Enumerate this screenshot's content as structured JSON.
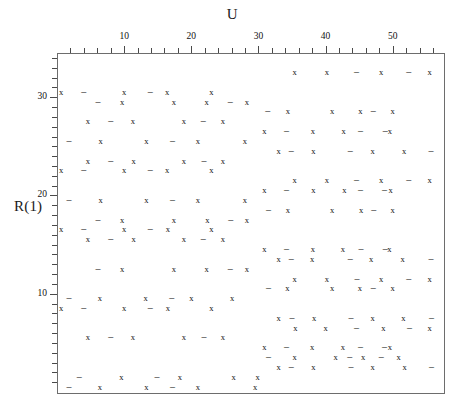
{
  "axes": {
    "x_title": "U",
    "y_title": "R(1)",
    "x_ticklabels": [
      "10",
      "20",
      "30",
      "40",
      "50"
    ],
    "x_tickvalues": [
      10,
      20,
      30,
      40,
      50
    ],
    "y_ticklabels": [
      "10",
      "20",
      "30"
    ],
    "y_tickvalues": [
      10,
      20,
      30
    ]
  },
  "footer": {
    "speck": ""
  },
  "chart_data": {
    "type": "scatter",
    "title": "",
    "xlabel": "U",
    "ylabel": "R(1)",
    "xlim": [
      0,
      57.5
    ],
    "ylim": [
      34.5,
      0
    ],
    "grid": false,
    "legend": "none",
    "x_major_ticks": [
      10,
      20,
      30,
      40,
      50
    ],
    "x_minor_tick_step": 2,
    "y_major_ticks": [
      10,
      20,
      30
    ],
    "y_minor_tick_step": 1,
    "marker_glyphs": {
      "x": "x",
      "dash": "–"
    },
    "series": [
      {
        "name": "x-markers",
        "glyph": "x",
        "points": [
          [
            6.4,
            0.55
          ],
          [
            13.3,
            0.55
          ],
          [
            21.0,
            0.55
          ],
          [
            29.5,
            0.55
          ],
          [
            9.6,
            1.55
          ],
          [
            18.3,
            1.55
          ],
          [
            26.3,
            1.55
          ],
          [
            29.9,
            1.55
          ],
          [
            33.0,
            2.55
          ],
          [
            38.2,
            2.55
          ],
          [
            47.0,
            2.55
          ],
          [
            51.8,
            2.55
          ],
          [
            35.4,
            3.55
          ],
          [
            41.5,
            3.55
          ],
          [
            45.6,
            3.55
          ],
          [
            50.9,
            3.55
          ],
          [
            30.9,
            4.55
          ],
          [
            38.0,
            4.55
          ],
          [
            42.6,
            4.55
          ],
          [
            49.6,
            4.55
          ],
          [
            4.6,
            5.55
          ],
          [
            11.3,
            5.55
          ],
          [
            18.9,
            5.55
          ],
          [
            24.7,
            5.55
          ],
          [
            35.5,
            6.55
          ],
          [
            40.0,
            6.55
          ],
          [
            48.6,
            6.55
          ],
          [
            55.5,
            6.55
          ],
          [
            33.0,
            7.55
          ],
          [
            38.3,
            7.55
          ],
          [
            47.0,
            7.55
          ],
          [
            51.6,
            7.55
          ],
          [
            0.6,
            8.55
          ],
          [
            10.0,
            8.55
          ],
          [
            16.5,
            8.55
          ],
          [
            23.0,
            8.55
          ],
          [
            6.4,
            9.55
          ],
          [
            13.2,
            9.55
          ],
          [
            20.0,
            9.55
          ],
          [
            26.1,
            9.55
          ],
          [
            34.3,
            10.55
          ],
          [
            41.0,
            10.55
          ],
          [
            45.1,
            10.55
          ],
          [
            50.0,
            10.55
          ],
          [
            35.4,
            11.55
          ],
          [
            40.2,
            11.55
          ],
          [
            48.3,
            11.55
          ],
          [
            55.5,
            11.55
          ],
          [
            9.7,
            12.55
          ],
          [
            17.4,
            12.55
          ],
          [
            22.3,
            12.55
          ],
          [
            28.3,
            12.55
          ],
          [
            33.0,
            13.55
          ],
          [
            38.0,
            13.55
          ],
          [
            46.8,
            13.55
          ],
          [
            51.5,
            13.55
          ],
          [
            30.9,
            14.55
          ],
          [
            38.1,
            14.55
          ],
          [
            42.6,
            14.55
          ],
          [
            49.5,
            14.55
          ],
          [
            4.6,
            15.55
          ],
          [
            11.4,
            15.55
          ],
          [
            18.9,
            15.55
          ],
          [
            24.7,
            15.55
          ],
          [
            0.6,
            16.55
          ],
          [
            10.0,
            16.55
          ],
          [
            16.5,
            16.55
          ],
          [
            23.0,
            16.55
          ],
          [
            9.7,
            17.55
          ],
          [
            17.4,
            17.55
          ],
          [
            22.4,
            17.55
          ],
          [
            28.3,
            17.55
          ],
          [
            34.4,
            18.55
          ],
          [
            41.0,
            18.55
          ],
          [
            45.3,
            18.55
          ],
          [
            50.0,
            18.55
          ],
          [
            6.5,
            19.55
          ],
          [
            13.3,
            19.55
          ],
          [
            21.0,
            19.55
          ],
          [
            28.0,
            19.55
          ],
          [
            30.9,
            20.55
          ],
          [
            38.2,
            20.55
          ],
          [
            42.8,
            20.55
          ],
          [
            49.7,
            20.55
          ],
          [
            35.4,
            21.55
          ],
          [
            40.2,
            21.55
          ],
          [
            48.3,
            21.55
          ],
          [
            55.5,
            21.55
          ],
          [
            0.6,
            22.55
          ],
          [
            10.0,
            22.55
          ],
          [
            16.4,
            22.55
          ],
          [
            23.0,
            22.55
          ],
          [
            4.6,
            23.55
          ],
          [
            11.4,
            23.55
          ],
          [
            18.9,
            23.55
          ],
          [
            24.7,
            23.55
          ],
          [
            33.0,
            24.55
          ],
          [
            38.2,
            24.55
          ],
          [
            47.0,
            24.55
          ],
          [
            51.7,
            24.55
          ],
          [
            6.5,
            25.55
          ],
          [
            13.3,
            25.55
          ],
          [
            21.0,
            25.55
          ],
          [
            28.0,
            25.55
          ],
          [
            30.9,
            26.55
          ],
          [
            38.1,
            26.55
          ],
          [
            42.7,
            26.55
          ],
          [
            49.6,
            26.55
          ],
          [
            4.6,
            27.55
          ],
          [
            11.3,
            27.55
          ],
          [
            18.9,
            27.55
          ],
          [
            24.7,
            27.55
          ],
          [
            34.4,
            28.55
          ],
          [
            41.0,
            28.55
          ],
          [
            45.2,
            28.55
          ],
          [
            50.0,
            28.55
          ],
          [
            9.7,
            29.55
          ],
          [
            17.4,
            29.55
          ],
          [
            22.3,
            29.55
          ],
          [
            28.3,
            29.55
          ],
          [
            0.6,
            30.55
          ],
          [
            10.0,
            30.55
          ],
          [
            16.4,
            30.55
          ],
          [
            23.0,
            30.55
          ],
          [
            35.4,
            32.55
          ],
          [
            40.2,
            32.55
          ],
          [
            48.3,
            32.55
          ],
          [
            55.5,
            32.55
          ]
        ]
      },
      {
        "name": "dash-markers",
        "glyph": "dash",
        "points": [
          [
            1.8,
            0.55
          ],
          [
            17.2,
            0.55
          ],
          [
            3.3,
            1.55
          ],
          [
            14.9,
            1.55
          ],
          [
            34.9,
            2.55
          ],
          [
            43.8,
            2.55
          ],
          [
            55.8,
            2.55
          ],
          [
            31.5,
            3.55
          ],
          [
            43.6,
            3.55
          ],
          [
            48.3,
            3.55
          ],
          [
            34.2,
            4.55
          ],
          [
            45.2,
            4.55
          ],
          [
            48.8,
            4.55
          ],
          [
            8.0,
            5.55
          ],
          [
            21.9,
            5.55
          ],
          [
            44.6,
            6.55
          ],
          [
            52.5,
            6.55
          ],
          [
            35.0,
            7.55
          ],
          [
            43.8,
            7.55
          ],
          [
            55.8,
            7.55
          ],
          [
            4.0,
            8.55
          ],
          [
            13.9,
            8.55
          ],
          [
            1.8,
            9.55
          ],
          [
            17.1,
            9.55
          ],
          [
            31.5,
            10.55
          ],
          [
            47.1,
            10.55
          ],
          [
            44.7,
            11.55
          ],
          [
            52.4,
            11.55
          ],
          [
            6.1,
            12.55
          ],
          [
            25.8,
            12.55
          ],
          [
            34.9,
            13.55
          ],
          [
            43.7,
            13.55
          ],
          [
            55.7,
            13.55
          ],
          [
            34.2,
            14.55
          ],
          [
            45.3,
            14.55
          ],
          [
            48.9,
            14.55
          ],
          [
            8.0,
            15.55
          ],
          [
            21.8,
            15.55
          ],
          [
            4.0,
            16.55
          ],
          [
            13.9,
            16.55
          ],
          [
            6.1,
            17.55
          ],
          [
            25.9,
            17.55
          ],
          [
            31.5,
            18.55
          ],
          [
            47.2,
            18.55
          ],
          [
            1.8,
            19.55
          ],
          [
            17.2,
            19.55
          ],
          [
            34.2,
            20.55
          ],
          [
            45.2,
            20.55
          ],
          [
            48.8,
            20.55
          ],
          [
            44.6,
            21.55
          ],
          [
            52.4,
            21.55
          ],
          [
            4.0,
            22.55
          ],
          [
            13.9,
            22.55
          ],
          [
            8.0,
            23.55
          ],
          [
            21.9,
            23.55
          ],
          [
            34.9,
            24.55
          ],
          [
            43.7,
            24.55
          ],
          [
            55.7,
            24.55
          ],
          [
            1.8,
            25.55
          ],
          [
            17.2,
            25.55
          ],
          [
            34.2,
            26.55
          ],
          [
            45.2,
            26.55
          ],
          [
            48.9,
            26.55
          ],
          [
            8.0,
            27.55
          ],
          [
            21.8,
            27.55
          ],
          [
            31.4,
            28.55
          ],
          [
            47.1,
            28.55
          ],
          [
            6.1,
            29.55
          ],
          [
            25.8,
            29.55
          ],
          [
            4.0,
            30.55
          ],
          [
            13.9,
            30.55
          ],
          [
            44.6,
            32.55
          ],
          [
            52.4,
            32.55
          ]
        ]
      }
    ]
  }
}
